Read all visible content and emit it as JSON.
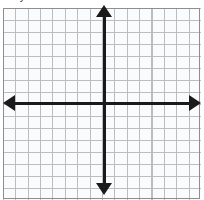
{
  "caption": {
    "fragment_text": "a? y"
  },
  "colors": {
    "background": "#ffffff",
    "grid_line": "#8e8e8e",
    "axis": "#1a1a1a",
    "caption_text": "#3a3a3a"
  },
  "graph": {
    "type": "coordinate-plane",
    "x_axis_label": "",
    "y_axis_label": "",
    "origin_label": "",
    "tick_labels": [],
    "plotted_points": [],
    "plotted_curves": []
  },
  "chart_data": {
    "type": "scatter",
    "title": "",
    "subtitle": "",
    "xlabel": "",
    "ylabel": "",
    "xlim": [
      -8,
      8
    ],
    "ylim": [
      -8,
      8
    ],
    "xticks": [
      -8,
      -7,
      -6,
      -5,
      -4,
      -3,
      -2,
      -1,
      0,
      1,
      2,
      3,
      4,
      5,
      6,
      7,
      8
    ],
    "yticks": [
      -8,
      -7,
      -6,
      -5,
      -4,
      -3,
      -2,
      -1,
      0,
      1,
      2,
      3,
      4,
      5,
      6,
      7,
      8
    ],
    "xtick_labels": [],
    "ytick_labels": [],
    "grid": true,
    "grid_columns": 16,
    "grid_rows": 16,
    "legend": false,
    "legend_position": "none",
    "series": [],
    "x": [],
    "values": [],
    "annotations": [],
    "axis_arrows": [
      "up",
      "down",
      "left",
      "right"
    ],
    "origin": [
      0,
      0
    ]
  }
}
